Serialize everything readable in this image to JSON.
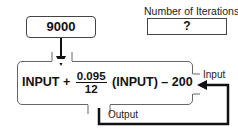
{
  "input_box": {
    "value": "9000"
  },
  "iterations": {
    "label": "Number of Iterations",
    "value": "?"
  },
  "function": {
    "prefix": "INPUT +",
    "numerator": "0.095",
    "denominator": "12",
    "suffix": "(INPUT) – 200"
  },
  "labels": {
    "input": "Input",
    "output": "Output"
  }
}
